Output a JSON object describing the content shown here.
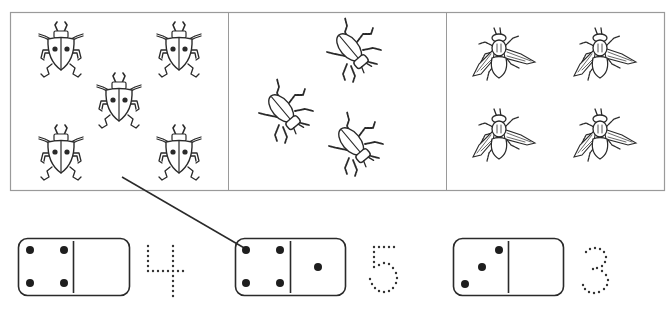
{
  "worksheet": {
    "task": "count-and-match",
    "panel_border_color": "#9a9a9a",
    "ink_color": "#2a2a2a",
    "groups": [
      {
        "id": "ladybugs",
        "insect": "ladybug-icon",
        "count": 5
      },
      {
        "id": "beetles",
        "insect": "beetle-icon",
        "count": 3
      },
      {
        "id": "flies",
        "insect": "fly-icon",
        "count": 4
      }
    ],
    "dominoes": [
      {
        "left_pips": 4,
        "right_pips": 0,
        "trace_number": "4"
      },
      {
        "left_pips": 4,
        "right_pips": 1,
        "trace_number": "5"
      },
      {
        "left_pips": 3,
        "right_pips": 0,
        "trace_number": "3"
      }
    ],
    "match_lines": [
      {
        "from_group": "ladybugs",
        "to_domino": 2
      }
    ]
  }
}
